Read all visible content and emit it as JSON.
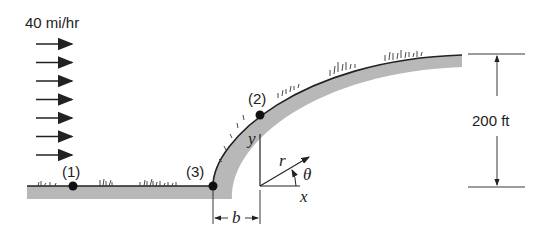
{
  "wind": {
    "speed_label": "40 mi/hr",
    "arrow_count": 7
  },
  "points": [
    {
      "id": "1",
      "label": "(1)"
    },
    {
      "id": "2",
      "label": "(2)"
    },
    {
      "id": "3",
      "label": "(3)"
    }
  ],
  "dimensions": {
    "height_label": "200 ft",
    "offset_label": "b"
  },
  "axes": {
    "x_label": "x",
    "y_label": "y",
    "r_label": "r",
    "theta_label": "θ"
  },
  "colors": {
    "ground_fill": "#b8b8b8",
    "line": "#222222",
    "point": "#111111"
  }
}
